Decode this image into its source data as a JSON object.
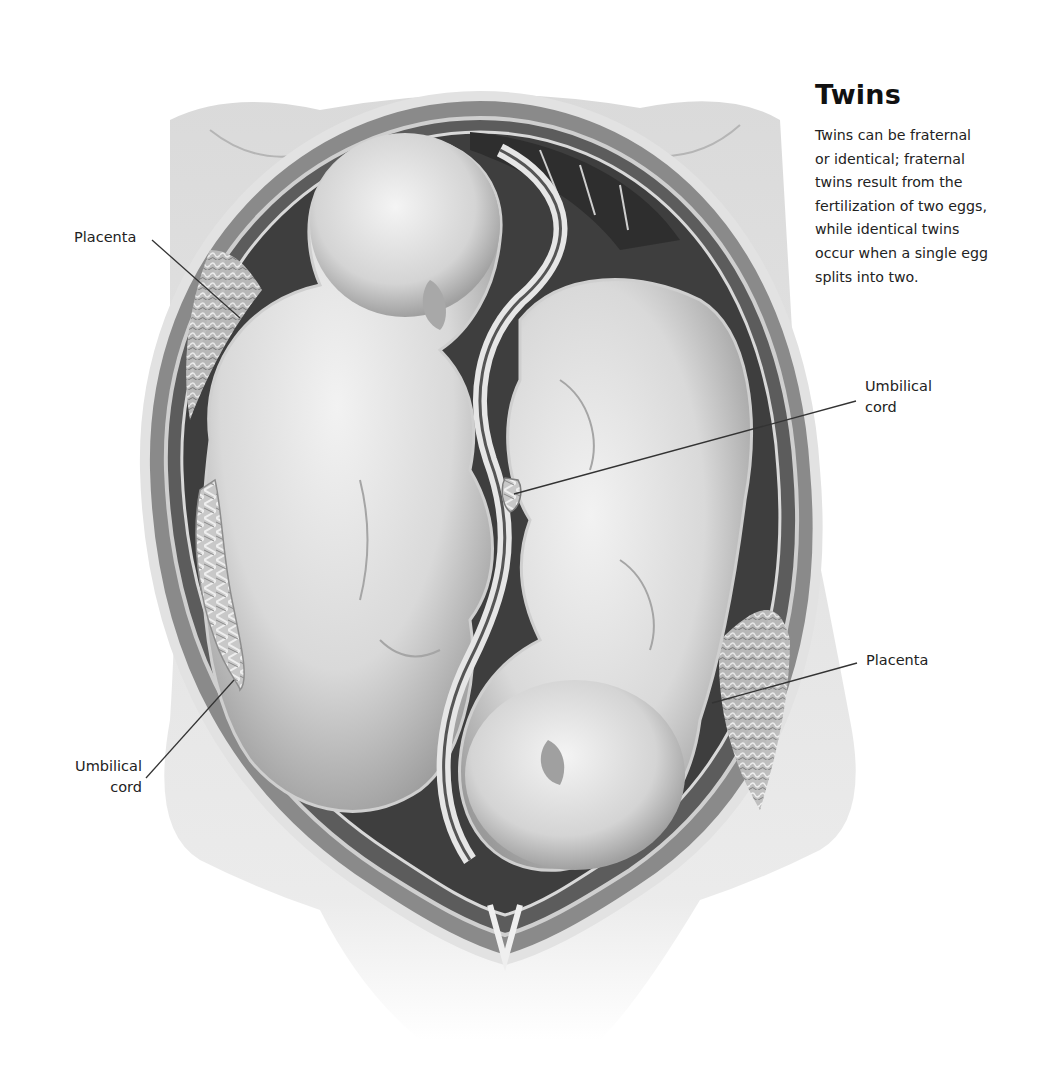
{
  "figure": {
    "title": "Twins",
    "caption": "Twins can be fraternal or identical; fraternal twins result from the fertilization of two eggs, while identical twins occur when a single egg splits into two.",
    "caption_lines": [
      "Twins can be fraternal",
      "or identical; fraternal",
      "twins result from the",
      "fertilization of two eggs,",
      "while identical twins",
      "occur when a single egg",
      "splits into two."
    ],
    "illustration": "cutaway-uterus-with-twins",
    "palette": {
      "background": "#ffffff",
      "skin_light": "#e6e6e6",
      "skin_mid": "#bdbdbd",
      "membrane_dark": "#3a3a3a",
      "uterus_wall": "#7a7a7a",
      "text": "#1a1a1a"
    }
  },
  "labels": {
    "placenta_left": "Placenta",
    "umbilical_left_line1": "Umbilical",
    "umbilical_left_line2": "cord",
    "umbilical_right_line1": "Umbilical",
    "umbilical_right_line2": "cord",
    "placenta_right": "Placenta"
  }
}
